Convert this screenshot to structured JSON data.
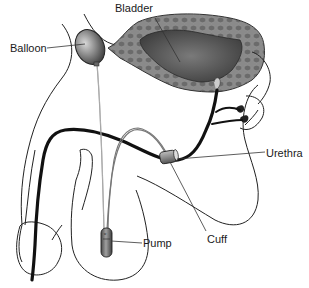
{
  "diagram": {
    "type": "anatomical illustration",
    "labels": {
      "bladder": "Bladder",
      "balloon": "Balloon",
      "urethra": "Urethra",
      "cuff": "Cuff",
      "pump": "Pump"
    },
    "colors": {
      "background": "#ffffff",
      "outline": "#222222",
      "bladder_wall": "#8a8a8a",
      "bladder_cells": "#6b6b6b",
      "bladder_lumen": "#4a4a4a",
      "urethra": "#111111",
      "tubing": "#777777",
      "device_gray": "#7a7a7a"
    }
  }
}
